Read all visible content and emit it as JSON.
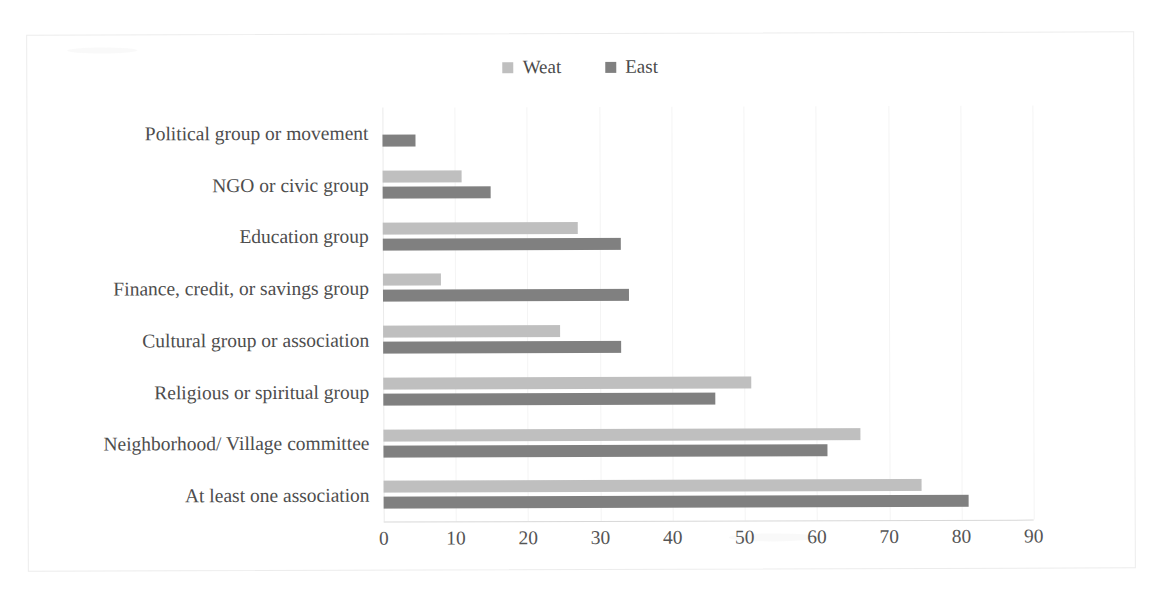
{
  "scan_artifact_text": "· · · · · · ·",
  "chart_data": {
    "type": "bar",
    "orientation": "horizontal",
    "title": "",
    "xlabel": "",
    "ylabel": "",
    "xlim": [
      0,
      90
    ],
    "xticks": [
      0,
      10,
      20,
      30,
      40,
      50,
      60,
      70,
      80,
      90
    ],
    "grid": true,
    "legend_position": "top-center",
    "categories": [
      "Political group or movement",
      "NGO or civic group",
      "Education group",
      "Finance, credit, or savings group",
      "Cultural group or association",
      "Religious or spiritual group",
      "Neighborhood/ Village committee",
      "At least one association"
    ],
    "series": [
      {
        "name": "Weat",
        "color": "#bfbfbf",
        "values": [
          null,
          11,
          27,
          8,
          24.5,
          51,
          66,
          74.5
        ]
      },
      {
        "name": "East",
        "color": "#808080",
        "values": [
          4.5,
          15,
          33,
          34,
          33,
          46,
          61.5,
          81
        ]
      }
    ]
  },
  "legend": {
    "entries": [
      {
        "label": "Weat",
        "color": "#bfbfbf"
      },
      {
        "label": "East",
        "color": "#808080"
      }
    ]
  },
  "colors": {
    "west": "#bfbfbf",
    "east": "#808080",
    "frame_border": "#ececec",
    "gridline": "#f4f4f4",
    "axis": "#d8d8d8",
    "text": "#4d4d4d",
    "background": "#ffffff"
  }
}
